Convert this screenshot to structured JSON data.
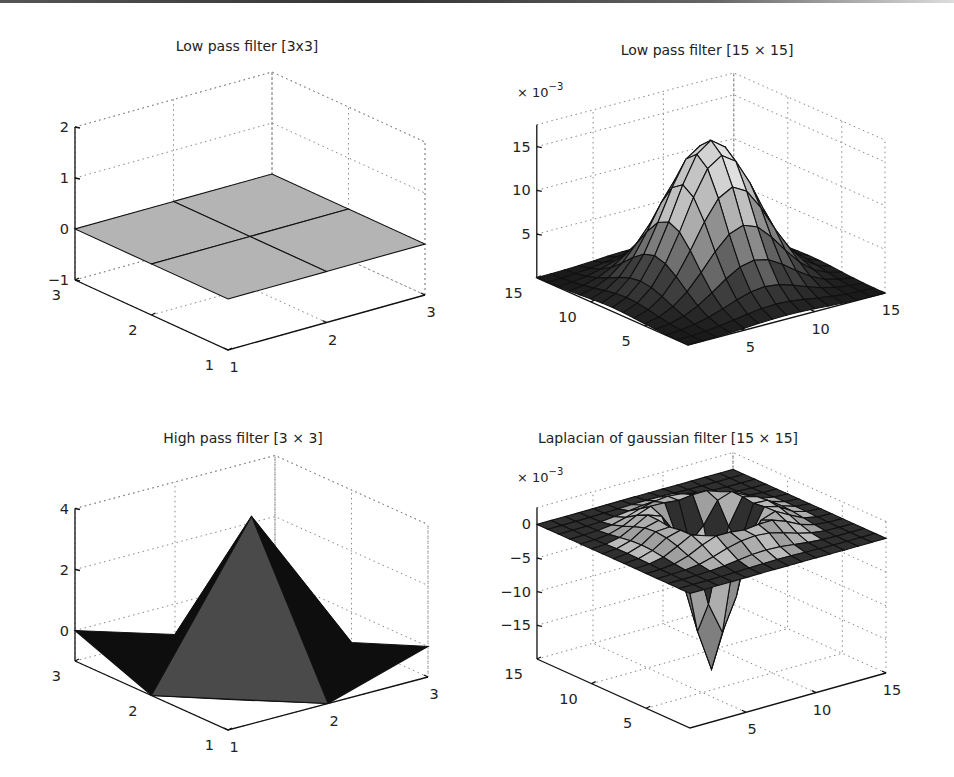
{
  "chart_data": [
    {
      "type": "surface",
      "title": "Low pass filter [3x3]",
      "xlabel": "",
      "ylabel": "",
      "zlabel": "",
      "x_ticks": [
        1,
        2,
        3
      ],
      "y_ticks": [
        1,
        2,
        3
      ],
      "z_ticks": [
        -1,
        0,
        1,
        2
      ],
      "zlim": [
        -1,
        2
      ],
      "grid": true,
      "z_multiplier": "",
      "values": [
        [
          0,
          0,
          0
        ],
        [
          0,
          0,
          0
        ],
        [
          0,
          0,
          0
        ]
      ],
      "face_color": "#b4b4b4"
    },
    {
      "type": "surface",
      "title": "Low pass filter [15 × 15]",
      "xlabel": "",
      "ylabel": "",
      "zlabel": "",
      "x_ticks": [
        5,
        10,
        15
      ],
      "y_ticks": [
        5,
        10,
        15
      ],
      "z_ticks": [
        5,
        10,
        15
      ],
      "zlim": [
        0,
        17
      ],
      "grid": true,
      "z_multiplier": "× 10^-3",
      "description": "2D gaussian, peak ≈ 16.5e-3 at center (8,8), size 15×15"
    },
    {
      "type": "surface",
      "title": "High pass filter [3 × 3]",
      "xlabel": "",
      "ylabel": "",
      "zlabel": "",
      "x_ticks": [
        1,
        2,
        3
      ],
      "y_ticks": [
        1,
        2,
        3
      ],
      "z_ticks": [
        0,
        2,
        4
      ],
      "zlim": [
        -1,
        4
      ],
      "grid": true,
      "z_multiplier": "",
      "values": [
        [
          0,
          -1,
          0
        ],
        [
          -1,
          4,
          -1
        ],
        [
          0,
          -1,
          0
        ]
      ]
    },
    {
      "type": "surface",
      "title": "Laplacian of gaussian filter [15 × 15]",
      "xlabel": "",
      "ylabel": "",
      "zlabel": "",
      "x_ticks": [
        5,
        10,
        15
      ],
      "y_ticks": [
        5,
        10,
        15
      ],
      "z_ticks": [
        0,
        -5,
        -10,
        -15
      ],
      "zlim": [
        -20,
        2
      ],
      "grid": true,
      "z_multiplier": "× 10^-3",
      "description": "Laplacian of Gaussian, minimum ≈ -21e-3 at center, ring of positive values ≈ +2e-3"
    }
  ],
  "panels": [
    {
      "title": "Low pass filter [3x3]",
      "title_pos": [
        247,
        51
      ],
      "exp": "",
      "origin": [
        228,
        350
      ],
      "ux": [
        98.5,
        -27.5
      ],
      "uy": [
        -76.5,
        -35
      ],
      "zbase": -1,
      "zscale": 51,
      "n": 3,
      "xmin": 1,
      "zticks": [
        -1,
        0,
        1,
        2
      ],
      "zlabels": [
        "−1",
        "0",
        "1",
        "2"
      ],
      "ztop": 2,
      "xt": [
        1,
        2,
        3
      ],
      "yt": [
        1,
        2,
        3
      ],
      "kind": "flat"
    },
    {
      "title": "Low pass filter [15 × 15]",
      "title_pos": [
        707,
        55
      ],
      "exp": "× 10",
      "exp_sup": "−3",
      "exp_pos": [
        517,
        97
      ],
      "origin": [
        688,
        345
      ],
      "ux": [
        14.07,
        -3.7
      ],
      "uy": [
        -10.8,
        -4.8
      ],
      "zbase": 0,
      "zscale": 8.75,
      "n": 15,
      "xmin": 1,
      "zticks": [
        5,
        10,
        15
      ],
      "zlabels": [
        "5",
        "10",
        "15"
      ],
      "ztop": 17.5,
      "xt": [
        5,
        10,
        15
      ],
      "yt": [
        5,
        10,
        15
      ],
      "kind": "gauss"
    },
    {
      "title": "High pass filter [3 × 3]",
      "title_pos": [
        243,
        443
      ],
      "exp": "",
      "origin": [
        228,
        730
      ],
      "ux": [
        100,
        -26.5
      ],
      "uy": [
        -76.5,
        -34.5
      ],
      "zbase": -1,
      "zscale": 30.5,
      "n": 3,
      "xmin": 1,
      "zticks": [
        0,
        2,
        4
      ],
      "zlabels": [
        "0",
        "2",
        "4"
      ],
      "ztop": 4,
      "xt": [
        1,
        2,
        3
      ],
      "yt": [
        1,
        2,
        3
      ],
      "kind": "highpass"
    },
    {
      "title": "Laplacian of gaussian filter [15 × 15]",
      "title_pos": [
        668,
        443
      ],
      "exp": "× 10",
      "exp_sup": "−3",
      "exp_pos": [
        517,
        482
      ],
      "origin": [
        690,
        728
      ],
      "ux": [
        14.0,
        -3.93
      ],
      "uy": [
        -10.93,
        -4.93
      ],
      "zbase": -20,
      "zscale": 6.73,
      "n": 15,
      "xmin": 1,
      "zticks": [
        0,
        -5,
        -10,
        -15
      ],
      "zlabels": [
        "0",
        "−5",
        "−10",
        "−15"
      ],
      "ztop": 2.5,
      "xt": [
        5,
        10,
        15
      ],
      "yt": [
        5,
        10,
        15
      ],
      "kind": "log"
    }
  ]
}
